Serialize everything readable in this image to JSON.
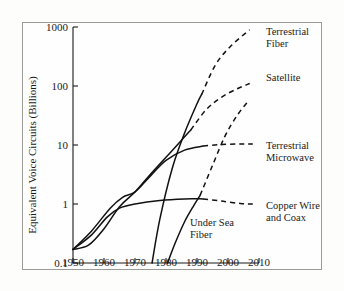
{
  "chart_data": {
    "type": "line",
    "title": "",
    "xlabel": "",
    "ylabel": "Equivalent Voice Circuits (Billions)",
    "xlim": [
      1950,
      2010
    ],
    "ylim": [
      0.1,
      1000
    ],
    "yscale": "log",
    "grid": false,
    "legend_position": "right-inline-labels",
    "xticks": [
      "1950",
      "1960",
      "1970",
      "1980",
      "1990",
      "2000",
      "2010"
    ],
    "yticks": [
      "1000",
      "100",
      "10",
      "1",
      "0.1"
    ],
    "series": [
      {
        "name": "Terrestrial Fiber",
        "label": "Terrestrial Fiber",
        "label_line1": "Terrestrial",
        "label_line2": "Fiber",
        "style": "solid-then-dashed",
        "solid_points": [
          [
            1975.5,
            0.1
          ],
          [
            1978,
            0.55
          ],
          [
            1982,
            4.0
          ],
          [
            1986,
            16
          ],
          [
            1990,
            50
          ],
          [
            1991.5,
            72
          ]
        ],
        "dashed_points": [
          [
            1991.5,
            72
          ],
          [
            1996,
            230
          ],
          [
            2001,
            480
          ],
          [
            2007,
            900
          ]
        ]
      },
      {
        "name": "Satellite",
        "label": "Satellite",
        "style": "solid-then-dashed",
        "solid_points": [
          [
            1950,
            0.17
          ],
          [
            1955,
            0.2
          ],
          [
            1960,
            0.38
          ],
          [
            1965,
            0.9
          ],
          [
            1970,
            1.6
          ],
          [
            1975,
            3.2
          ],
          [
            1980,
            6.2
          ],
          [
            1985,
            12
          ],
          [
            1988,
            18
          ]
        ],
        "dashed_points": [
          [
            1988,
            18
          ],
          [
            1993,
            40
          ],
          [
            1998,
            65
          ],
          [
            2003,
            90
          ],
          [
            2007,
            110
          ]
        ]
      },
      {
        "name": "Terrestrial Microwave",
        "label": "Terrestrial Microwave",
        "label_line1": "Terrestrial",
        "label_line2": "Microwave",
        "style": "solid-then-dashed",
        "solid_points": [
          [
            1950,
            0.17
          ],
          [
            1956,
            0.35
          ],
          [
            1962,
            0.85
          ],
          [
            1966,
            1.3
          ],
          [
            1970,
            1.6
          ],
          [
            1975,
            3.0
          ],
          [
            1980,
            5.5
          ],
          [
            1986,
            8.2
          ],
          [
            1992,
            9.6
          ]
        ],
        "dashed_points": [
          [
            1992,
            9.6
          ],
          [
            1998,
            10.2
          ],
          [
            2004,
            10.4
          ],
          [
            2008,
            10.4
          ]
        ]
      },
      {
        "name": "Copper Wire and Coax",
        "label": "Copper Wire and Coax",
        "label_line1": "Copper Wire",
        "label_line2": "and Coax",
        "style": "solid-then-dashed",
        "solid_points": [
          [
            1950,
            0.17
          ],
          [
            1956,
            0.3
          ],
          [
            1961,
            0.6
          ],
          [
            1965,
            0.85
          ],
          [
            1970,
            1.0
          ],
          [
            1978,
            1.15
          ],
          [
            1986,
            1.22
          ],
          [
            1992,
            1.22
          ]
        ],
        "dashed_points": [
          [
            1992,
            1.22
          ],
          [
            1998,
            1.12
          ],
          [
            2004,
            1.02
          ],
          [
            2008,
            1.0
          ]
        ]
      },
      {
        "name": "Under Sea Fiber",
        "label": "Under Sea Fiber",
        "label_line1": "Under Sea",
        "label_line2": "Fiber",
        "style": "solid-then-dashed",
        "solid_points": [
          [
            1980.5,
            0.1
          ],
          [
            1983,
            0.22
          ],
          [
            1986,
            0.5
          ],
          [
            1989,
            0.95
          ],
          [
            1991,
            1.4
          ]
        ],
        "dashed_points": [
          [
            1991,
            1.4
          ],
          [
            1995,
            4.5
          ],
          [
            1999,
            14
          ],
          [
            2003,
            32
          ],
          [
            2006.5,
            55
          ]
        ]
      }
    ]
  },
  "axes": {
    "ylabel": "Equivalent Voice Circuits (Billions)"
  }
}
